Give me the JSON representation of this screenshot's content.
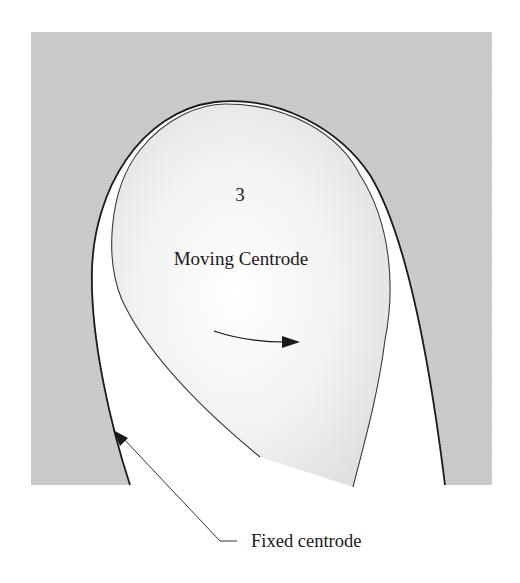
{
  "diagram": {
    "type": "kinematics-centrodes",
    "labels": {
      "link_number": "3",
      "moving_centrode": "Moving Centrode",
      "fixed_centrode": "Fixed centrode"
    },
    "colors": {
      "background": "#ffffff",
      "fixed_region": "#c8c8c8",
      "moving_body_center": "#ffffff",
      "moving_body_edge": "#e0e0e0",
      "stroke": "#1a1a1a"
    },
    "annotations": {
      "rotation_arrow": "clockwise rotation direction",
      "leader_arrow": "points to fixed centrode curve"
    }
  }
}
